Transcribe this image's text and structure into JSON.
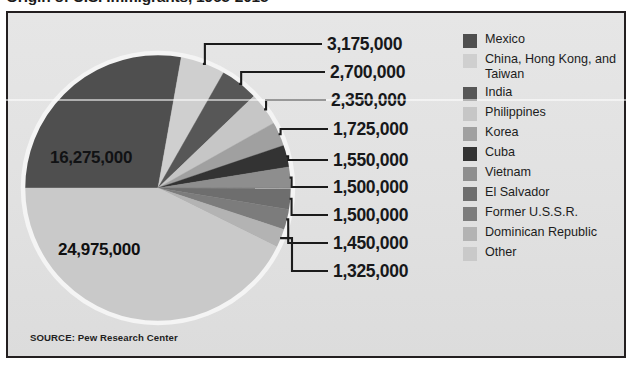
{
  "chart_title": "Origin of U.S. Immigrants, 1965-2015",
  "source": "SOURCE: Pew Research Center",
  "colors": {
    "panel_background": "#e3e3e3",
    "panel_border": "#231f20",
    "page_background": "#ffffff",
    "label_text": "#17181a",
    "leader_line": "#1b1b1b",
    "pie_outline": "#f2f2f2"
  },
  "legend": {
    "items": [
      {
        "label": "Mexico",
        "color": "#4f4f4f"
      },
      {
        "label": "China, Hong Kong, and Taiwan",
        "color": "#cfcfcf"
      },
      {
        "label": "India",
        "color": "#575757"
      },
      {
        "label": "Philippines",
        "color": "#c6c6c6"
      },
      {
        "label": "Korea",
        "color": "#a0a0a0"
      },
      {
        "label": "Cuba",
        "color": "#333333"
      },
      {
        "label": "Vietnam",
        "color": "#8e8e8e"
      },
      {
        "label": "El Salvador",
        "color": "#6e6e6e"
      },
      {
        "label": "Former U.S.S.R.",
        "color": "#7c7c7c"
      },
      {
        "label": "Dominican Republic",
        "color": "#b3b3b3"
      },
      {
        "label": "Other",
        "color": "#c9c9c9"
      }
    ]
  },
  "chart_data": {
    "type": "pie",
    "title": "Origin of U.S. Immigrants, 1965-2015",
    "xlabel": "",
    "ylabel": "",
    "legend_position": "right",
    "grid": false,
    "total": 58525000,
    "categories": [
      "Mexico",
      "China, Hong Kong, and Taiwan",
      "India",
      "Philippines",
      "Korea",
      "Cuba",
      "Vietnam",
      "El Salvador",
      "Former U.S.S.R.",
      "Dominican Republic",
      "Other"
    ],
    "values": [
      16275000,
      3175000,
      2700000,
      2350000,
      1725000,
      1550000,
      1500000,
      1500000,
      1450000,
      1325000,
      24975000
    ],
    "value_labels": [
      "16,275,000",
      "3,175,000",
      "2,700,000",
      "2,350,000",
      "1,725,000",
      "1,550,000",
      "1,500,000",
      "1,500,000",
      "1,450,000",
      "1,325,000",
      "24,975,000"
    ],
    "colors": [
      "#4f4f4f",
      "#cfcfcf",
      "#575757",
      "#c6c6c6",
      "#a0a0a0",
      "#333333",
      "#8e8e8e",
      "#6e6e6e",
      "#7c7c7c",
      "#b3b3b3",
      "#c9c9c9"
    ],
    "start_angle_deg": 180,
    "direction": "clockwise"
  },
  "callouts": [
    {
      "text": "3,175,000",
      "category": "China, Hong Kong, and Taiwan"
    },
    {
      "text": "2,700,000",
      "category": "India"
    },
    {
      "text": "2,350,000",
      "category": "Philippines"
    },
    {
      "text": "1,725,000",
      "category": "Korea"
    },
    {
      "text": "1,550,000",
      "category": "Cuba"
    },
    {
      "text": "1,500,000",
      "category": "Vietnam"
    },
    {
      "text": "1,500,000",
      "category": "El Salvador"
    },
    {
      "text": "1,450,000",
      "category": "Former U.S.S.R."
    },
    {
      "text": "1,325,000",
      "category": "Dominican Republic"
    }
  ],
  "inner_labels": [
    {
      "text": "16,275,000",
      "category": "Mexico"
    },
    {
      "text": "24,975,000",
      "category": "Other"
    }
  ]
}
